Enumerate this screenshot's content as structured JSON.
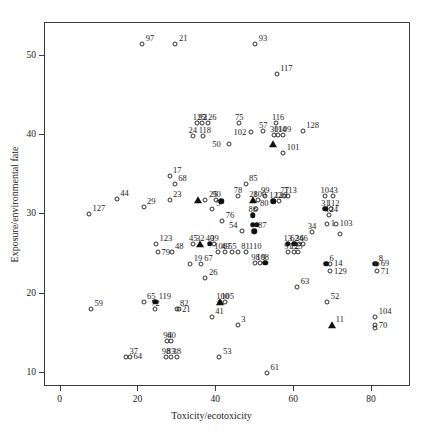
{
  "chart_data": {
    "type": "scatter",
    "title": "",
    "xlabel": "Toxicity/ecotoxicity",
    "ylabel": "Exposure/environmental fate",
    "xlim": [
      -4,
      90
    ],
    "ylim": [
      8.2,
      54.2
    ],
    "xticks": [
      0,
      20,
      40,
      60,
      80
    ],
    "yticks": [
      10,
      20,
      30,
      40,
      50
    ],
    "grid": false,
    "legend": "none",
    "marker_styles": [
      "open-circle",
      "filled-circle",
      "filled-triangle"
    ],
    "points": [
      {
        "label": "97",
        "x": 21.0,
        "y": 51.6,
        "m": "o",
        "lp": "ne"
      },
      {
        "label": "21",
        "x": 29.5,
        "y": 51.6,
        "m": "o",
        "lp": "ne"
      },
      {
        "label": "93",
        "x": 50.0,
        "y": 51.6,
        "m": "o",
        "lp": "ne"
      },
      {
        "label": "117",
        "x": 55.5,
        "y": 47.7,
        "m": "o",
        "lp": "ne"
      },
      {
        "label": "125",
        "x": 35.0,
        "y": 41.5,
        "m": "o",
        "lp": "n"
      },
      {
        "label": "92",
        "x": 36.4,
        "y": 41.5,
        "m": "o",
        "lp": "n"
      },
      {
        "label": "126",
        "x": 37.8,
        "y": 41.5,
        "m": "o",
        "lp": "n"
      },
      {
        "label": "75",
        "x": 45.8,
        "y": 41.5,
        "m": "o",
        "lp": "n"
      },
      {
        "label": "116",
        "x": 55.3,
        "y": 41.5,
        "m": "o",
        "lp": "n"
      },
      {
        "label": "57",
        "x": 52.0,
        "y": 40.5,
        "m": "o",
        "lp": "n"
      },
      {
        "label": "128",
        "x": 62.2,
        "y": 40.6,
        "m": "o",
        "lp": "ne"
      },
      {
        "label": "24",
        "x": 33.9,
        "y": 39.9,
        "m": "o",
        "lp": "n"
      },
      {
        "label": "118",
        "x": 36.5,
        "y": 39.9,
        "m": "o",
        "lp": "n"
      },
      {
        "label": "102",
        "x": 48.8,
        "y": 40.4,
        "m": "o",
        "lp": "w"
      },
      {
        "label": "114",
        "x": 55.8,
        "y": 40.1,
        "m": "o",
        "lp": "n"
      },
      {
        "label": "109",
        "x": 57.0,
        "y": 40.1,
        "m": "o",
        "lp": "n"
      },
      {
        "label": "50",
        "x": 43.3,
        "y": 38.9,
        "m": "o",
        "lp": "w"
      },
      {
        "label": "30",
        "x": 54.8,
        "y": 40.1,
        "m": "o",
        "lp": "n"
      },
      {
        "label": "3-t",
        "x": 54.6,
        "y": 38.9,
        "m": "t",
        "lp": "none"
      },
      {
        "label": "101",
        "x": 57.2,
        "y": 37.8,
        "m": "o",
        "lp": "ne"
      },
      {
        "label": "17",
        "x": 28.0,
        "y": 34.9,
        "m": "o",
        "lp": "ne"
      },
      {
        "label": "68",
        "x": 29.3,
        "y": 33.9,
        "m": "o",
        "lp": "ne"
      },
      {
        "label": "85",
        "x": 47.5,
        "y": 33.9,
        "m": "o",
        "lp": "ne"
      },
      {
        "label": "44",
        "x": 14.4,
        "y": 32.0,
        "m": "o",
        "lp": "ne"
      },
      {
        "label": "23",
        "x": 28.0,
        "y": 31.8,
        "m": "o",
        "lp": "ne"
      },
      {
        "label": "29",
        "x": 21.3,
        "y": 31.0,
        "m": "o",
        "lp": "ne"
      },
      {
        "label": "127",
        "x": 7.3,
        "y": 30.0,
        "m": "o",
        "lp": "ne"
      },
      {
        "label": "25t",
        "x": 35.3,
        "y": 31.8,
        "m": "t",
        "lp": "none"
      },
      {
        "label": "25",
        "x": 37.2,
        "y": 31.8,
        "m": "o",
        "lp": "ne"
      },
      {
        "label": "90",
        "x": 40.0,
        "y": 31.8,
        "m": "o",
        "lp": "n"
      },
      {
        "label": "78",
        "x": 45.5,
        "y": 32.3,
        "m": "o",
        "lp": "n"
      },
      {
        "label": "65b",
        "x": 41.3,
        "y": 31.7,
        "m": "f",
        "lp": "none"
      },
      {
        "label": "28",
        "x": 49.5,
        "y": 31.8,
        "m": "t",
        "lp": "n"
      },
      {
        "label": "100",
        "x": 50.6,
        "y": 31.8,
        "m": "o",
        "lp": "n"
      },
      {
        "label": "99",
        "x": 52.5,
        "y": 32.3,
        "m": "o",
        "lp": "n"
      },
      {
        "label": "77",
        "x": 57.5,
        "y": 32.3,
        "m": "o",
        "lp": "n"
      },
      {
        "label": "113",
        "x": 58.5,
        "y": 32.3,
        "m": "o",
        "lp": "n"
      },
      {
        "label": "122",
        "x": 54.6,
        "y": 31.7,
        "m": "f",
        "lp": "n"
      },
      {
        "label": "120",
        "x": 56.0,
        "y": 31.7,
        "m": "o",
        "lp": "n"
      },
      {
        "label": "10",
        "x": 67.8,
        "y": 32.3,
        "m": "o",
        "lp": "n"
      },
      {
        "label": "43",
        "x": 70.0,
        "y": 32.3,
        "m": "o",
        "lp": "n"
      },
      {
        "label": "80",
        "x": 50.3,
        "y": 30.7,
        "m": "o",
        "lp": "ne"
      },
      {
        "label": "5",
        "x": 39.0,
        "y": 30.7,
        "m": "o",
        "lp": "ne"
      },
      {
        "label": "31",
        "x": 68.0,
        "y": 30.7,
        "m": "f",
        "lp": "n"
      },
      {
        "label": "112",
        "x": 69.5,
        "y": 30.7,
        "m": "o",
        "lp": "n"
      },
      {
        "label": "76",
        "x": 41.5,
        "y": 29.2,
        "m": "o",
        "lp": "ne"
      },
      {
        "label": "86",
        "x": 49.3,
        "y": 29.9,
        "m": "f",
        "lp": "n"
      },
      {
        "label": "124",
        "x": 69.0,
        "y": 29.9,
        "m": "o",
        "lp": "n"
      },
      {
        "label": "82b",
        "x": 49.3,
        "y": 28.7,
        "m": "f",
        "lp": "none"
      },
      {
        "label": "32b",
        "x": 50.4,
        "y": 28.7,
        "m": "f",
        "lp": "none"
      },
      {
        "label": "1",
        "x": 68.5,
        "y": 28.8,
        "m": "o",
        "lp": "e"
      },
      {
        "label": "103",
        "x": 70.8,
        "y": 28.8,
        "m": "o",
        "lp": "e"
      },
      {
        "label": "54",
        "x": 46.6,
        "y": 27.9,
        "m": "o",
        "lp": "nw"
      },
      {
        "label": "87",
        "x": 49.8,
        "y": 27.9,
        "m": "f",
        "lp": "ne"
      },
      {
        "label": "34",
        "x": 64.5,
        "y": 27.8,
        "m": "o",
        "lp": "n"
      },
      {
        "label": "6b",
        "x": 71.8,
        "y": 27.5,
        "m": "o",
        "lp": "none"
      },
      {
        "label": "123",
        "x": 24.5,
        "y": 26.3,
        "m": "o",
        "lp": "ne"
      },
      {
        "label": "79",
        "x": 25.0,
        "y": 25.2,
        "m": "o",
        "lp": "e"
      },
      {
        "label": "48",
        "x": 28.5,
        "y": 25.2,
        "m": "o",
        "lp": "ne"
      },
      {
        "label": "45",
        "x": 34.0,
        "y": 26.3,
        "m": "o",
        "lp": "n"
      },
      {
        "label": "32",
        "x": 35.8,
        "y": 26.3,
        "m": "t",
        "lp": "n"
      },
      {
        "label": "40",
        "x": 38.3,
        "y": 26.3,
        "m": "f",
        "lp": "n"
      },
      {
        "label": "39",
        "x": 39.5,
        "y": 26.3,
        "m": "o",
        "lp": "n"
      },
      {
        "label": "106",
        "x": 40.5,
        "y": 25.3,
        "m": "o",
        "lp": "n"
      },
      {
        "label": "49",
        "x": 42.3,
        "y": 25.3,
        "m": "o",
        "lp": "n"
      },
      {
        "label": "55",
        "x": 44.0,
        "y": 25.3,
        "m": "o",
        "lp": "n"
      },
      {
        "label": "13",
        "x": 58.3,
        "y": 26.3,
        "m": "f",
        "lp": "n"
      },
      {
        "label": "62",
        "x": 60.0,
        "y": 26.3,
        "m": "f",
        "lp": "n"
      },
      {
        "label": "36",
        "x": 61.3,
        "y": 26.3,
        "m": "o",
        "lp": "n"
      },
      {
        "label": "46",
        "x": 62.3,
        "y": 26.3,
        "m": "o",
        "lp": "n"
      },
      {
        "label": "81",
        "x": 45.5,
        "y": 25.2,
        "m": "o",
        "lp": "ne"
      },
      {
        "label": "110",
        "x": 47.5,
        "y": 25.2,
        "m": "o",
        "lp": "ne"
      },
      {
        "label": "91",
        "x": 58.5,
        "y": 25.2,
        "m": "o",
        "lp": "n"
      },
      {
        "label": "12",
        "x": 60.0,
        "y": 25.2,
        "m": "o",
        "lp": "n"
      },
      {
        "label": "25b",
        "x": 61.0,
        "y": 25.2,
        "m": "o",
        "lp": "n"
      },
      {
        "label": "19",
        "x": 33.3,
        "y": 23.7,
        "m": "o",
        "lp": "ne"
      },
      {
        "label": "67",
        "x": 36.0,
        "y": 23.7,
        "m": "o",
        "lp": "ne"
      },
      {
        "label": "98",
        "x": 50.0,
        "y": 23.9,
        "m": "o",
        "lp": "n"
      },
      {
        "label": "108",
        "x": 51.3,
        "y": 23.9,
        "m": "o",
        "lp": "n"
      },
      {
        "label": "9",
        "x": 52.6,
        "y": 23.9,
        "m": "f",
        "lp": "n"
      },
      {
        "label": "6",
        "x": 68.2,
        "y": 23.8,
        "m": "f",
        "lp": "ne"
      },
      {
        "label": "14",
        "x": 69.3,
        "y": 23.8,
        "m": "o",
        "lp": "e"
      },
      {
        "label": "129",
        "x": 69.3,
        "y": 22.8,
        "m": "o",
        "lp": "e"
      },
      {
        "label": "8",
        "x": 80.8,
        "y": 23.8,
        "m": "f",
        "lp": "ne"
      },
      {
        "label": "69",
        "x": 81.3,
        "y": 23.8,
        "m": "o",
        "lp": "e"
      },
      {
        "label": "71",
        "x": 81.3,
        "y": 22.8,
        "m": "o",
        "lp": "e"
      },
      {
        "label": "26",
        "x": 37.2,
        "y": 22.0,
        "m": "o",
        "lp": "ne"
      },
      {
        "label": "63",
        "x": 60.8,
        "y": 20.9,
        "m": "o",
        "lp": "ne"
      },
      {
        "label": "100b",
        "x": 41.0,
        "y": 19.0,
        "m": "o",
        "lp": "n"
      },
      {
        "label": "105",
        "x": 42.3,
        "y": 19.0,
        "m": "o",
        "lp": "n"
      },
      {
        "label": "21b",
        "x": 41.0,
        "y": 19.0,
        "m": "t",
        "lp": "none"
      },
      {
        "label": "65",
        "x": 21.3,
        "y": 19.0,
        "m": "o",
        "lp": "ne"
      },
      {
        "label": "119",
        "x": 24.3,
        "y": 19.0,
        "m": "f",
        "lp": "ne"
      },
      {
        "label": "72",
        "x": 24.3,
        "y": 18.0,
        "m": "o",
        "lp": "n"
      },
      {
        "label": "82",
        "x": 29.8,
        "y": 18.0,
        "m": "o",
        "lp": "ne"
      },
      {
        "label": "21c",
        "x": 30.3,
        "y": 18.0,
        "m": "o",
        "lp": "e"
      },
      {
        "label": "52",
        "x": 68.5,
        "y": 19.0,
        "m": "o",
        "lp": "ne"
      },
      {
        "label": "41",
        "x": 38.8,
        "y": 17.1,
        "m": "o",
        "lp": "ne"
      },
      {
        "label": "59",
        "x": 7.8,
        "y": 18.0,
        "m": "o",
        "lp": "ne"
      },
      {
        "label": "3",
        "x": 45.5,
        "y": 16.0,
        "m": "o",
        "lp": "ne"
      },
      {
        "label": "11",
        "x": 69.8,
        "y": 16.0,
        "m": "t",
        "lp": "ne"
      },
      {
        "label": "104",
        "x": 80.8,
        "y": 17.0,
        "m": "o",
        "lp": "ne"
      },
      {
        "label": "70",
        "x": 80.8,
        "y": 16.0,
        "m": "o",
        "lp": "e"
      },
      {
        "label": "4",
        "x": 80.8,
        "y": 15.6,
        "m": "o",
        "lp": "none"
      },
      {
        "label": "94",
        "x": 27.4,
        "y": 14.0,
        "m": "o",
        "lp": "n"
      },
      {
        "label": "60",
        "x": 28.4,
        "y": 14.0,
        "m": "o",
        "lp": "n"
      },
      {
        "label": "37",
        "x": 16.8,
        "y": 12.0,
        "m": "o",
        "lp": "ne"
      },
      {
        "label": "64",
        "x": 17.8,
        "y": 12.0,
        "m": "o",
        "lp": "e"
      },
      {
        "label": "98b",
        "x": 27.0,
        "y": 12.0,
        "m": "o",
        "lp": "n"
      },
      {
        "label": "83",
        "x": 28.3,
        "y": 12.0,
        "m": "o",
        "lp": "n"
      },
      {
        "label": "38",
        "x": 29.8,
        "y": 12.0,
        "m": "o",
        "lp": "n"
      },
      {
        "label": "53",
        "x": 40.8,
        "y": 12.0,
        "m": "o",
        "lp": "ne"
      },
      {
        "label": "61",
        "x": 53.0,
        "y": 10.0,
        "m": "o",
        "lp": "ne"
      }
    ]
  },
  "axes": {
    "x_label": "Toxicity/ecotoxicity",
    "y_label": "Exposure/environmental fate",
    "x_ticklabels": [
      "0",
      "20",
      "40",
      "60",
      "80"
    ],
    "y_ticklabels": [
      "10",
      "20",
      "30",
      "40",
      "50"
    ]
  },
  "colors": {
    "frame": "#3a3a3a",
    "marker": "#111111",
    "text": "#1a1a1a",
    "background": "#ffffff"
  }
}
